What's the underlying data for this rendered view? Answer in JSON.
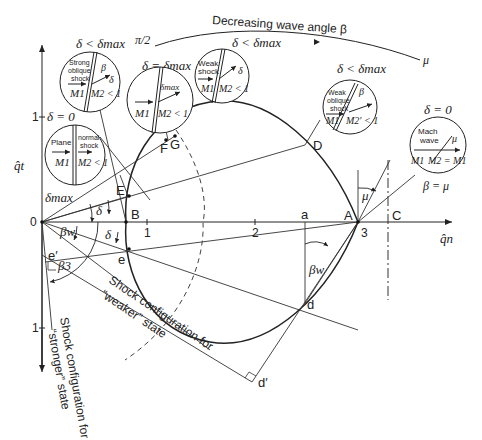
{
  "diagram": {
    "type": "shock-polar",
    "axes": {
      "x_label": "q̂n",
      "y_label": "q̂t",
      "x_ticks": [
        "1",
        "2",
        "3"
      ],
      "y_tick_top": "1",
      "y_tick_bottom": "1",
      "origin": "0"
    },
    "points": {
      "A": "A",
      "B": "B",
      "C": "C",
      "D": "D",
      "E": "E",
      "F": "F",
      "G": "G",
      "a": "a",
      "d": "d",
      "d_prime": "d′",
      "e": "e",
      "e_prime": "e′"
    },
    "angles": {
      "delta_max": "δmax",
      "delta": "δ",
      "delta2": "δ",
      "beta_w": "βw",
      "beta_w2": "βw",
      "beta_3": "β3",
      "mu": "μ"
    },
    "top_arc": {
      "label": "Decreasing wave angle β",
      "start": "π/2",
      "end": "μ"
    },
    "insets": [
      {
        "id": "plane-normal",
        "cond": "δ = 0",
        "line1": "Plane",
        "line2": "normal",
        "line3": "shock",
        "m1": "M1",
        "m2": "M2 < 1"
      },
      {
        "id": "strong-oblique",
        "cond": "δ < δmax",
        "line1": "Strong",
        "line2": "oblique",
        "line3": "shock",
        "m1": "M1",
        "m2": "M2 < 1",
        "beta": "β",
        "delta": "δ"
      },
      {
        "id": "max-deflection",
        "cond": "δ = δmax",
        "m1": "M1",
        "m2": "M2 < 1",
        "delta": "δmax"
      },
      {
        "id": "weak-shock",
        "cond": "δ < δmax",
        "line1": "Weak",
        "line2": "shock",
        "m1": "M1",
        "m2": "M2 < 1",
        "delta": "δ"
      },
      {
        "id": "weak-oblique",
        "cond": "δ < δmax",
        "line1": "Weak",
        "line2": "oblique",
        "line3": "shock",
        "m1": "M1",
        "m2": "M2′ < 1",
        "beta": "β"
      },
      {
        "id": "mach-wave",
        "cond": "δ = 0",
        "line1": "Mach",
        "line2": "wave",
        "m1": "M1",
        "m2": "M2 = M1",
        "mu": "μ",
        "below": "β = μ"
      }
    ],
    "captions": {
      "weaker": [
        "Shock configuration for",
        "“weaker” state"
      ],
      "stronger": [
        "Shock configuration for",
        "“stronger” state"
      ]
    }
  }
}
